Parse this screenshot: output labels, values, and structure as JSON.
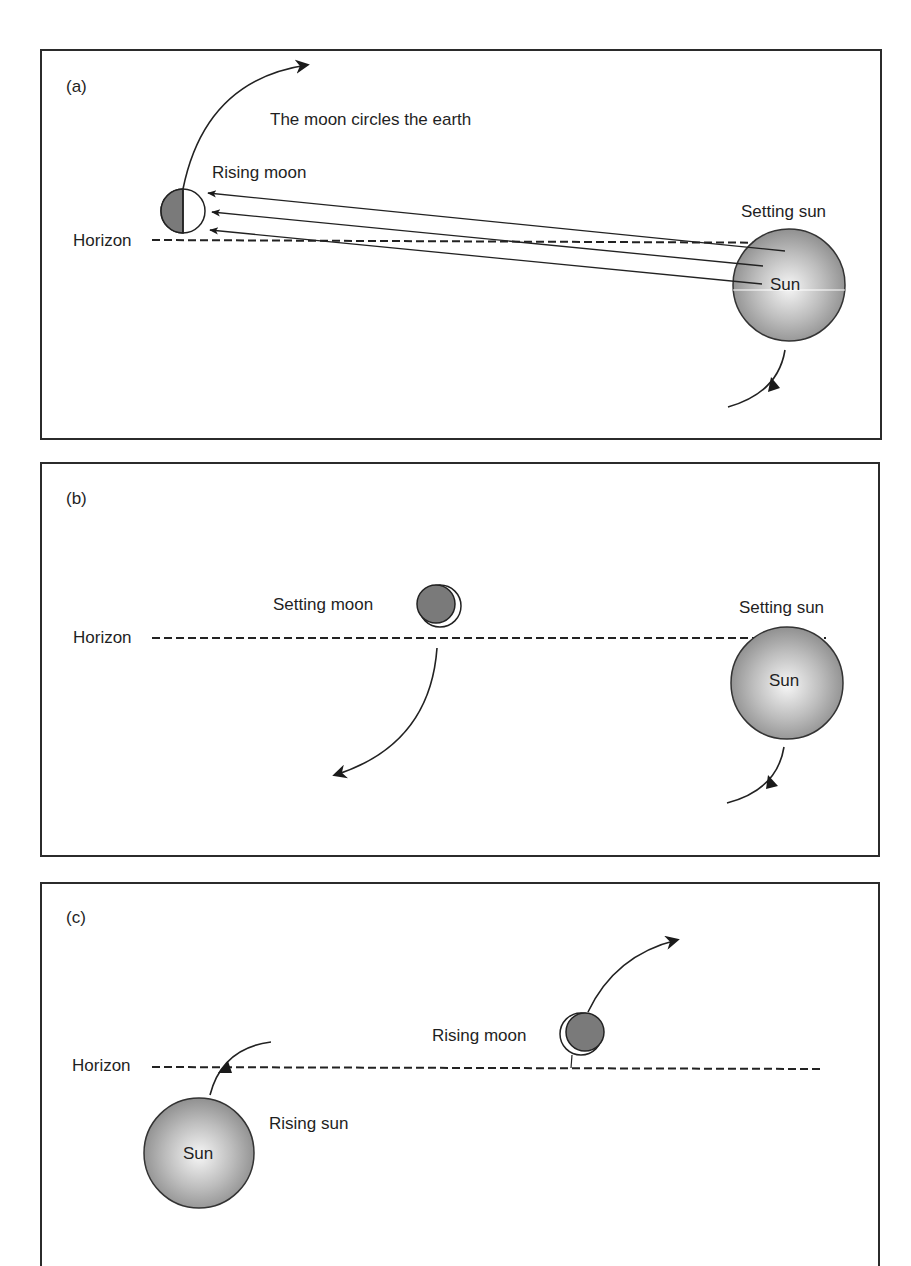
{
  "figure": {
    "panels": [
      {
        "id": "a",
        "label": "(a)",
        "horizon_label": "Horizon",
        "arc_label": "The moon circles the earth",
        "moon_label": "Rising moon",
        "moon_phase": "first-quarter (half lit, right side)",
        "sun_label": "Setting sun",
        "sun_text": "Sun"
      },
      {
        "id": "b",
        "label": "(b)",
        "horizon_label": "Horizon",
        "moon_label": "Setting moon",
        "moon_phase": "thin crescent lit on right",
        "sun_label": "Setting sun",
        "sun_text": "Sun"
      },
      {
        "id": "c",
        "label": "(c)",
        "horizon_label": "Horizon",
        "moon_label": "Rising moon",
        "moon_phase": "thin crescent lit on left",
        "sun_label": "Rising sun",
        "sun_text": "Sun"
      }
    ],
    "colors": {
      "frame": "#2b2b2b",
      "moon_dark": "#7a7a7a",
      "sun_center": "#f4f4f4",
      "sun_edge": "#8c8c8c"
    }
  }
}
